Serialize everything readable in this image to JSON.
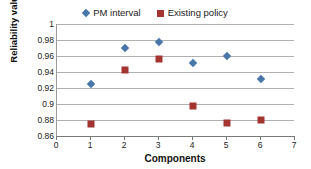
{
  "chart_data": {
    "type": "scatter",
    "title": "",
    "xlabel": "Components",
    "ylabel": "Reliability value",
    "xlim": [
      0,
      7
    ],
    "ylim": [
      0.86,
      1
    ],
    "grid": true,
    "legend_position": "top-center",
    "x_ticks": [
      "0",
      "1",
      "2",
      "3",
      "4",
      "5",
      "6",
      "7"
    ],
    "y_ticks": [
      "0.86",
      "0.88",
      "0.9",
      "0.92",
      "0.94",
      "0.96",
      "0.98",
      "1"
    ],
    "categories": [
      1,
      2,
      3,
      4,
      5,
      6
    ],
    "series": [
      {
        "name": "PM interval",
        "marker": "diamond",
        "color": "#4876a8",
        "values": [
          0.925,
          0.97,
          0.977,
          0.951,
          0.96,
          0.931
        ]
      },
      {
        "name": "Existing policy",
        "marker": "square",
        "color": "#a33430",
        "values": [
          0.875,
          0.942,
          0.956,
          0.897,
          0.876,
          0.88
        ]
      }
    ]
  }
}
